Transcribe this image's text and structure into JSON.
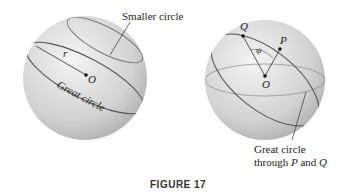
{
  "figure": {
    "caption": "FIGURE 17",
    "left_sphere": {
      "smaller_circle_label": "Smaller circle",
      "radius_label": "r",
      "center_label": "O",
      "great_circle_label": "Great circle"
    },
    "right_sphere": {
      "point_q_label": "Q",
      "point_p_label": "P",
      "angle_label": "ψ",
      "center_label": "O",
      "great_circle_label_line1": "Great circle",
      "great_circle_label_line2_prefix": "through ",
      "great_circle_label_p": "P",
      "great_circle_label_and": " and ",
      "great_circle_label_q": "Q"
    },
    "colors": {
      "sphere_light": "#f2f2f2",
      "sphere_dark": "#b5b5b5",
      "circle_line": "#555555"
    }
  }
}
